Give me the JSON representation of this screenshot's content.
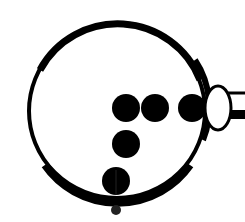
{
  "diagram": {
    "background": "#ffffff",
    "ink": "#000000",
    "outer_circle": {
      "cx": 117,
      "cy": 111,
      "rx": 89,
      "ry": 88
    },
    "dots": [
      {
        "cx": 126,
        "cy": 108,
        "r": 14
      },
      {
        "cx": 155,
        "cy": 108,
        "r": 14
      },
      {
        "cx": 192,
        "cy": 108,
        "r": 14
      },
      {
        "cx": 126,
        "cy": 144,
        "r": 14
      },
      {
        "cx": 116,
        "cy": 181,
        "r": 14
      }
    ],
    "small_dot": {
      "cx": 116,
      "cy": 210,
      "r": 5
    },
    "ellipse": {
      "cx": 218,
      "cy": 108,
      "rx": 13,
      "ry": 22
    },
    "connector": {
      "x": 231,
      "top_line_y": 93,
      "bottom_band_y": 111
    }
  }
}
